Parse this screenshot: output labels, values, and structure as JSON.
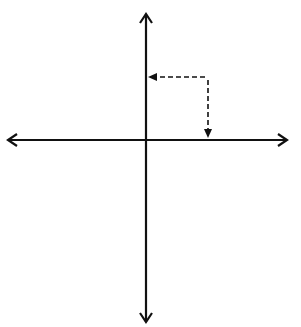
{
  "diagram": {
    "axes": {
      "x_label": "x",
      "y_label": "y",
      "x_ticks": [
        "-5",
        "-4",
        "-3",
        "-2",
        "-1",
        "1",
        "2",
        "3",
        "4",
        "5"
      ],
      "y_ticks": [
        "5",
        "4",
        "3",
        "2",
        "1",
        "-1",
        "-2",
        "-3",
        "-4",
        "-5"
      ]
    },
    "points": [
      {
        "label": "A",
        "x": 3,
        "y": 4
      },
      {
        "label": "B",
        "x": -4,
        "y": 4
      },
      {
        "label": "C",
        "x": 3,
        "y": -3
      }
    ],
    "annotations": {
      "y_coordinate": "y-coordinate",
      "x_coordinate": "x-coordinate"
    }
  }
}
